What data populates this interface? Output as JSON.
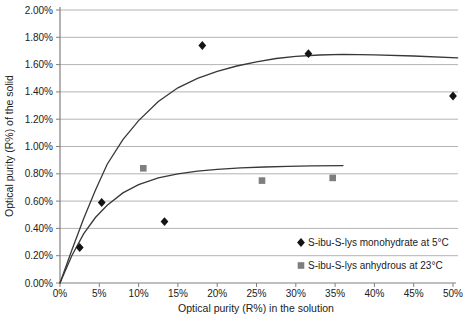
{
  "chart_data": {
    "type": "scatter",
    "title": "",
    "xlabel": "Optical purity (R%) in the solution",
    "ylabel": "Optical purity (R%) of the solid",
    "xlim": [
      0,
      50
    ],
    "ylim": [
      0,
      2
    ],
    "grid": "horizontal-only",
    "legend_position": "inside-lower-right",
    "x_tick_values": [
      0,
      5,
      10,
      15,
      20,
      25,
      30,
      35,
      40,
      45,
      50
    ],
    "x_tick_labels": [
      "0%",
      "5%",
      "10%",
      "15%",
      "20%",
      "25%",
      "30%",
      "35%",
      "40%",
      "45%",
      "50%"
    ],
    "y_tick_values": [
      0,
      0.2,
      0.4,
      0.6,
      0.8,
      1.0,
      1.2,
      1.4,
      1.6,
      1.8,
      2.0
    ],
    "y_tick_labels": [
      "0.00%",
      "0.20%",
      "0.40%",
      "0.60%",
      "0.80%",
      "1.00%",
      "1.20%",
      "1.40%",
      "1.60%",
      "1.80%",
      "2.00%"
    ],
    "colors": {
      "background": "#ffffff",
      "gridline": "#b3b3b3",
      "axis": "#808080",
      "text": "#212121",
      "trend_line": "#383838",
      "diamond_series": "#141414",
      "square_series": "#7e7e7e"
    },
    "series": [
      {
        "name": "S-ibu-S-lys monohydrate at 5°C",
        "marker": "diamond",
        "color": "#141414",
        "points": [
          [
            2.5,
            0.26
          ],
          [
            5.3,
            0.59
          ],
          [
            13.3,
            0.45
          ],
          [
            18.1,
            1.74
          ],
          [
            31.6,
            1.68
          ],
          [
            50,
            1.37
          ]
        ],
        "trend": [
          [
            0,
            0
          ],
          [
            1.5,
            0.24
          ],
          [
            3,
            0.47
          ],
          [
            4.5,
            0.68
          ],
          [
            6,
            0.87
          ],
          [
            8,
            1.05
          ],
          [
            10,
            1.19
          ],
          [
            12.5,
            1.33
          ],
          [
            15,
            1.43
          ],
          [
            17.5,
            1.5
          ],
          [
            20,
            1.55
          ],
          [
            22.5,
            1.59
          ],
          [
            25,
            1.62
          ],
          [
            27.5,
            1.645
          ],
          [
            30,
            1.66
          ],
          [
            33,
            1.67
          ],
          [
            36,
            1.675
          ],
          [
            40,
            1.672
          ],
          [
            45,
            1.663
          ],
          [
            50.6,
            1.65
          ]
        ]
      },
      {
        "name": "S-ibu-S-lys anhydrous at 23°C",
        "marker": "square",
        "color": "#7e7e7e",
        "points": [
          [
            10.6,
            0.84
          ],
          [
            25.7,
            0.75
          ],
          [
            34.7,
            0.77
          ]
        ],
        "trend": [
          [
            0,
            0
          ],
          [
            1.5,
            0.2
          ],
          [
            3,
            0.36
          ],
          [
            4.5,
            0.48
          ],
          [
            6,
            0.57
          ],
          [
            8,
            0.66
          ],
          [
            10,
            0.72
          ],
          [
            12.5,
            0.77
          ],
          [
            15,
            0.8
          ],
          [
            17.5,
            0.82
          ],
          [
            20,
            0.833
          ],
          [
            23,
            0.843
          ],
          [
            26,
            0.85
          ],
          [
            29,
            0.855
          ],
          [
            32,
            0.858
          ],
          [
            36,
            0.86
          ]
        ]
      }
    ]
  }
}
